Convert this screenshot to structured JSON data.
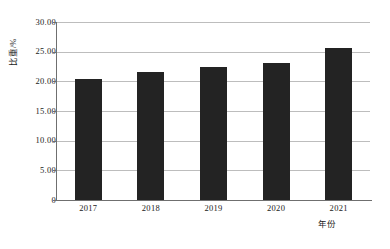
{
  "chart_data": {
    "type": "bar",
    "title": "",
    "subtitle": "",
    "xlabel": "年份",
    "ylabel": "比重/%",
    "categories": [
      "2017",
      "2018",
      "2019",
      "2020",
      "2021"
    ],
    "values": [
      20.4,
      21.5,
      22.4,
      23.1,
      25.6
    ],
    "series": [
      {
        "name": "比重/%",
        "values": [
          20.4,
          21.5,
          22.4,
          23.1,
          25.6
        ]
      }
    ],
    "ylim": [
      0,
      30
    ],
    "ytick_values": [
      30.0,
      25.0,
      20.0,
      15.0,
      10.0,
      5.0,
      0
    ],
    "ytick_labels": [
      "30.00",
      "25.00",
      "20.00",
      "15.00",
      "10.00",
      "5.00",
      "0"
    ],
    "xtick_labels": [
      "2017",
      "2018",
      "2019",
      "2020",
      "2021"
    ],
    "grid": true,
    "grid_axis": "y",
    "legend": false,
    "legend_position": "none",
    "bar_color": "#232323",
    "grid_color": "#bdbdbd",
    "axis_color": "#6f6f6f",
    "background_color": "#ffffff"
  },
  "axes": {
    "y_title": "比重/%",
    "x_title": "年份"
  },
  "y_ticks": [
    {
      "label": "30.00",
      "value": 30.0
    },
    {
      "label": "25.00",
      "value": 25.0
    },
    {
      "label": "20.00",
      "value": 20.0
    },
    {
      "label": "15.00",
      "value": 15.0
    },
    {
      "label": "10.00",
      "value": 10.0
    },
    {
      "label": "5.00",
      "value": 5.0
    },
    {
      "label": "0",
      "value": 0
    }
  ],
  "x_ticks": [
    {
      "label": "2017"
    },
    {
      "label": "2018"
    },
    {
      "label": "2019"
    },
    {
      "label": "2020"
    },
    {
      "label": "2021"
    }
  ],
  "bars": [
    {
      "category": "2017",
      "value": 20.4
    },
    {
      "category": "2018",
      "value": 21.5
    },
    {
      "category": "2019",
      "value": 22.4
    },
    {
      "category": "2020",
      "value": 23.1
    },
    {
      "category": "2021",
      "value": 25.6
    }
  ]
}
